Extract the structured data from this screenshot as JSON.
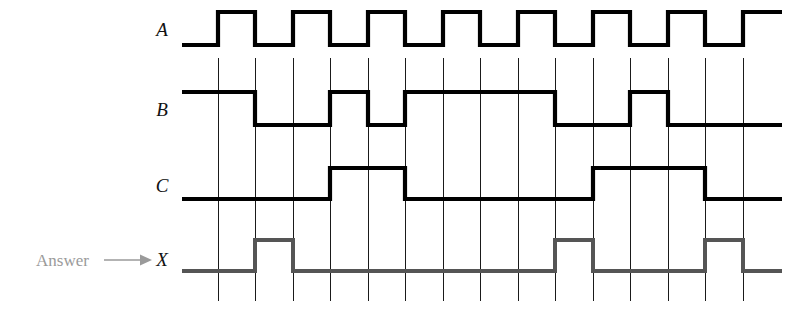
{
  "figure": {
    "answer_label": "Answer",
    "arrow_icon": "right-arrow-icon",
    "signals": [
      {
        "name": "A",
        "label": "A",
        "color": "#000000",
        "role": "input-clock"
      },
      {
        "name": "B",
        "label": "B",
        "color": "#000000",
        "role": "input"
      },
      {
        "name": "C",
        "label": "C",
        "color": "#000000",
        "role": "input"
      },
      {
        "name": "X",
        "label": "X",
        "color": "#555555",
        "role": "output-answer"
      }
    ]
  },
  "chart_data": {
    "type": "line",
    "subtype": "digital-timing-waveform",
    "xlabel": "",
    "ylabel": "",
    "grid": true,
    "legend": "none",
    "time_axis": {
      "start_px": 182,
      "end_px": 782,
      "tick_spacing_px": 37.5,
      "tick_count": 15,
      "tick_positions_px": [
        218,
        255,
        293,
        330,
        368,
        405,
        443,
        480,
        518,
        555,
        593,
        630,
        668,
        705,
        743
      ],
      "grid_top_px": 58,
      "grid_bottom_px": 301
    },
    "rows": [
      {
        "name": "A",
        "y_high_px": 12,
        "y_low_px": 45,
        "label_x_px": 162,
        "label_y_px": 36
      },
      {
        "name": "B",
        "y_high_px": 92,
        "y_low_px": 125,
        "label_x_px": 162,
        "label_y_px": 116
      },
      {
        "name": "C",
        "y_high_px": 168,
        "y_low_px": 199,
        "label_x_px": 162,
        "label_y_px": 192
      },
      {
        "name": "X",
        "y_high_px": 240,
        "y_low_px": 271,
        "label_x_px": 162,
        "label_y_px": 266
      }
    ],
    "series": [
      {
        "name": "A",
        "color": "#000000",
        "initial_level": 0,
        "transitions_px": [
          218,
          255,
          293,
          330,
          368,
          405,
          443,
          480,
          518,
          555,
          593,
          630,
          668,
          705,
          743
        ],
        "levels": [
          0,
          1,
          0,
          1,
          0,
          1,
          0,
          1,
          0,
          1,
          0,
          1,
          0,
          1,
          0,
          1
        ],
        "description": "Square clock: low for first half-period, then alternating every grid interval, ending high"
      },
      {
        "name": "B",
        "color": "#000000",
        "initial_level": 1,
        "transitions_px": [
          255,
          330,
          368,
          405,
          555,
          630,
          668
        ],
        "levels": [
          1,
          0,
          1,
          0,
          1,
          0,
          1,
          0
        ],
        "description": "High from start, low 255-330, high 330-368, low 368-405, high 405-555, low 555-630, high 630-668, low to end"
      },
      {
        "name": "C",
        "color": "#000000",
        "initial_level": 0,
        "transitions_px": [
          330,
          405,
          593,
          705
        ],
        "levels": [
          0,
          1,
          0,
          1,
          0
        ],
        "description": "Low from start, high 330-405, low 405-593, high 593-705, low to end"
      },
      {
        "name": "X",
        "color": "#555555",
        "initial_level": 0,
        "transitions_px": [
          255,
          293,
          555,
          593,
          705,
          743
        ],
        "levels": [
          0,
          1,
          0,
          1,
          0,
          1,
          0
        ],
        "description": "Answer output: three narrow pulses at 255-293, 555-593 and 705-743"
      }
    ]
  }
}
